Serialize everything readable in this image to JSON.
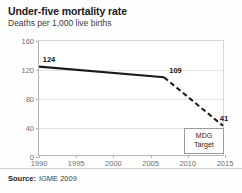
{
  "header": {
    "title": "Under-five mortality rate",
    "subtitle": "Deaths per 1,000 live births"
  },
  "footer": {
    "label": "Source:",
    "value": "IGME 2009"
  },
  "annotation": {
    "line1": "MDG",
    "line2": "Target"
  },
  "colors": {
    "line": "#1a1a1a",
    "grid": "#e6e6e6",
    "axis": "#b5b5b5",
    "text": "#1a1a1a",
    "muted": "#6e6e6e",
    "background": "#fefefe"
  },
  "chart_data": {
    "type": "line",
    "title": "Under-five mortality rate",
    "subtitle": "Deaths per 1,000 live births",
    "xlabel": "",
    "ylabel": "Deaths per 1,000 live births",
    "xlim": [
      1990,
      2015
    ],
    "ylim": [
      0,
      160
    ],
    "yticks": [
      0,
      40,
      80,
      120,
      160
    ],
    "xticks": [
      1990,
      1995,
      2000,
      2005,
      2010,
      2015
    ],
    "ytick_labels": [
      "0",
      "40",
      "80",
      "120",
      "160"
    ],
    "xtick_labels": [
      "1990",
      "1995",
      "2000",
      "2005",
      "2010",
      "2015"
    ],
    "grid": "horizontal",
    "legend": "none",
    "series": [
      {
        "name": "Observed",
        "style": "solid",
        "x": [
          1990,
          2007
        ],
        "values": [
          124,
          109
        ]
      },
      {
        "name": "MDG projection",
        "style": "dashed",
        "x": [
          2007,
          2015
        ],
        "values": [
          109,
          41
        ]
      }
    ],
    "point_labels": [
      {
        "x": 1990,
        "value": 124,
        "text": "124"
      },
      {
        "x": 2007,
        "value": 109,
        "text": "109"
      },
      {
        "x": 2015,
        "value": 41,
        "text": "41"
      }
    ],
    "annotations": [
      {
        "text": "MDG Target",
        "x": 2014,
        "y": 22
      }
    ],
    "source": "IGME 2009"
  }
}
